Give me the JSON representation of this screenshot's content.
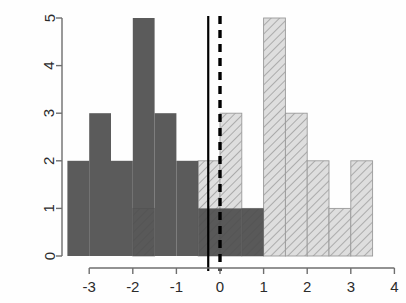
{
  "chart_data": {
    "type": "bar",
    "title": "",
    "subtitle": "",
    "xlabel": "",
    "ylabel": "",
    "xlim": [
      -3.75,
      4.15
    ],
    "ylim": [
      0,
      5
    ],
    "grid": false,
    "legend": null,
    "bin_width": 0.5,
    "x_ticks": [
      -3,
      -2,
      -1,
      0,
      1,
      2,
      3,
      4
    ],
    "x_tick_labels": [
      "-3",
      "-2",
      "-1",
      "0",
      "1",
      "2",
      "3",
      "4"
    ],
    "y_ticks": [
      0,
      1,
      2,
      3,
      4,
      5
    ],
    "y_tick_labels": [
      "0",
      "1",
      "2",
      "3",
      "4",
      "5"
    ],
    "bins": [
      [
        -3.5,
        -3.0
      ],
      [
        -3.0,
        -2.5
      ],
      [
        -2.5,
        -2.0
      ],
      [
        -2.0,
        -1.5
      ],
      [
        -1.5,
        -1.0
      ],
      [
        -1.0,
        -0.5
      ],
      [
        -0.5,
        0.0
      ],
      [
        0.0,
        0.5
      ],
      [
        0.5,
        1.0
      ],
      [
        1.0,
        1.5
      ],
      [
        1.5,
        2.0
      ],
      [
        2.0,
        2.5
      ],
      [
        2.5,
        3.0
      ],
      [
        3.0,
        3.5
      ]
    ],
    "series": [
      {
        "name": "dark-solid-histogram",
        "style": "solid",
        "color": "#4d4d4d",
        "values": [
          2,
          3,
          2,
          5,
          3,
          2,
          1,
          1,
          1,
          0,
          0,
          0,
          0,
          0
        ]
      },
      {
        "name": "light-hatched-histogram",
        "style": "hatched",
        "color": "#d9d9d9",
        "hatch_color": "#9a9a9a",
        "values": [
          0,
          0,
          0,
          1,
          0,
          0,
          2,
          3,
          1,
          5,
          3,
          2,
          1,
          2
        ]
      }
    ],
    "annotations": [
      {
        "name": "solid-vertical-line",
        "type": "vline",
        "x": -0.27,
        "style": "solid",
        "color": "#000000"
      },
      {
        "name": "dashed-vertical-line",
        "type": "vline",
        "x": 0.0,
        "style": "dashed",
        "color": "#000000"
      }
    ]
  },
  "axes": {
    "x_tick_labels": [
      "-3",
      "-2",
      "-1",
      "0",
      "1",
      "2",
      "3",
      "4"
    ],
    "y_tick_labels": [
      "0",
      "1",
      "2",
      "3",
      "4",
      "5"
    ]
  }
}
